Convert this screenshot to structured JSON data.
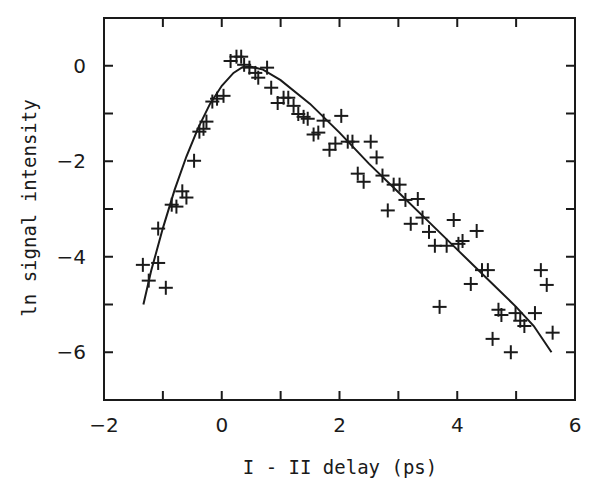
{
  "chart_data": {
    "type": "scatter",
    "title": "",
    "xlabel": "I - II delay (ps)",
    "ylabel": "ln signal intensity",
    "xlim": [
      -2,
      6
    ],
    "ylim": [
      -7,
      1
    ],
    "x_ticks": [
      -2,
      0,
      2,
      4,
      6
    ],
    "x_tick_labels": [
      "-2",
      "0",
      "2",
      "4",
      "6"
    ],
    "x_minor_ticks": [
      -1,
      1,
      3,
      5
    ],
    "y_ticks": [
      0,
      -2,
      -4,
      -6
    ],
    "y_tick_labels": [
      "0",
      "-2",
      "-4",
      "-6"
    ],
    "y_minor_ticks": [
      -1,
      -3,
      -5
    ],
    "grid": false,
    "legend": null,
    "series": [
      {
        "name": "measured",
        "type": "scatter",
        "marker": "+",
        "color": "#1a1a1a",
        "points": [
          [
            -1.34,
            -4.17
          ],
          [
            -1.24,
            -4.5
          ],
          [
            -1.08,
            -3.41
          ],
          [
            -1.08,
            -4.13
          ],
          [
            -0.95,
            -4.65
          ],
          [
            -0.85,
            -2.91
          ],
          [
            -0.77,
            -2.95
          ],
          [
            -0.67,
            -2.63
          ],
          [
            -0.6,
            -2.76
          ],
          [
            -0.47,
            -1.99
          ],
          [
            -0.38,
            -1.38
          ],
          [
            -0.31,
            -1.32
          ],
          [
            -0.26,
            -1.17
          ],
          [
            -0.16,
            -0.75
          ],
          [
            -0.08,
            -0.69
          ],
          [
            0.03,
            -0.63
          ],
          [
            0.15,
            0.1
          ],
          [
            0.25,
            0.19
          ],
          [
            0.33,
            0.19
          ],
          [
            0.38,
            0.02
          ],
          [
            0.47,
            -0.04
          ],
          [
            0.57,
            -0.15
          ],
          [
            0.62,
            -0.25
          ],
          [
            0.77,
            -0.04
          ],
          [
            0.84,
            -0.46
          ],
          [
            0.95,
            -0.78
          ],
          [
            1.05,
            -0.67
          ],
          [
            1.13,
            -0.67
          ],
          [
            1.22,
            -0.84
          ],
          [
            1.3,
            -1.01
          ],
          [
            1.39,
            -1.07
          ],
          [
            1.46,
            -1.11
          ],
          [
            1.56,
            -1.44
          ],
          [
            1.64,
            -1.4
          ],
          [
            1.73,
            -1.15
          ],
          [
            1.83,
            -1.76
          ],
          [
            1.93,
            -1.63
          ],
          [
            2.03,
            -1.05
          ],
          [
            2.14,
            -1.59
          ],
          [
            2.22,
            -1.59
          ],
          [
            2.31,
            -2.26
          ],
          [
            2.41,
            -2.43
          ],
          [
            2.53,
            -1.59
          ],
          [
            2.63,
            -1.92
          ],
          [
            2.73,
            -2.3
          ],
          [
            2.82,
            -3.03
          ],
          [
            2.92,
            -2.49
          ],
          [
            3.02,
            -2.49
          ],
          [
            3.12,
            -2.81
          ],
          [
            3.33,
            -2.79
          ],
          [
            3.21,
            -3.31
          ],
          [
            3.41,
            -3.18
          ],
          [
            3.52,
            -3.48
          ],
          [
            3.62,
            -3.77
          ],
          [
            3.7,
            -5.05
          ],
          [
            3.82,
            -3.77
          ],
          [
            3.94,
            -3.23
          ],
          [
            4.02,
            -3.73
          ],
          [
            4.09,
            -3.67
          ],
          [
            4.33,
            -3.46
          ],
          [
            4.23,
            -4.57
          ],
          [
            4.42,
            -4.28
          ],
          [
            4.52,
            -4.28
          ],
          [
            4.6,
            -5.72
          ],
          [
            4.7,
            -5.11
          ],
          [
            4.75,
            -5.22
          ],
          [
            4.91,
            -6.0
          ],
          [
            4.99,
            -5.18
          ],
          [
            5.07,
            -5.34
          ],
          [
            5.14,
            -5.45
          ],
          [
            5.32,
            -5.18
          ],
          [
            5.42,
            -4.28
          ],
          [
            5.52,
            -4.59
          ],
          [
            5.62,
            -5.59
          ]
        ]
      },
      {
        "name": "fit",
        "type": "line",
        "color": "#1a1a1a",
        "points": [
          [
            -1.33,
            -5.0
          ],
          [
            -1.2,
            -4.3
          ],
          [
            -1.0,
            -3.4
          ],
          [
            -0.8,
            -2.6
          ],
          [
            -0.6,
            -1.9
          ],
          [
            -0.4,
            -1.3
          ],
          [
            -0.2,
            -0.8
          ],
          [
            0.0,
            -0.42
          ],
          [
            0.2,
            -0.15
          ],
          [
            0.35,
            -0.03
          ],
          [
            0.5,
            -0.02
          ],
          [
            0.7,
            -0.08
          ],
          [
            1.0,
            -0.3
          ],
          [
            1.5,
            -0.8
          ],
          [
            2.0,
            -1.4
          ],
          [
            2.5,
            -2.05
          ],
          [
            3.0,
            -2.65
          ],
          [
            3.5,
            -3.25
          ],
          [
            4.0,
            -3.85
          ],
          [
            4.5,
            -4.45
          ],
          [
            5.0,
            -5.05
          ],
          [
            5.3,
            -5.45
          ],
          [
            5.6,
            -6.0
          ]
        ]
      }
    ]
  },
  "axes": {
    "x_title": "I - II delay (ps)",
    "y_title": "ln signal intensity"
  }
}
